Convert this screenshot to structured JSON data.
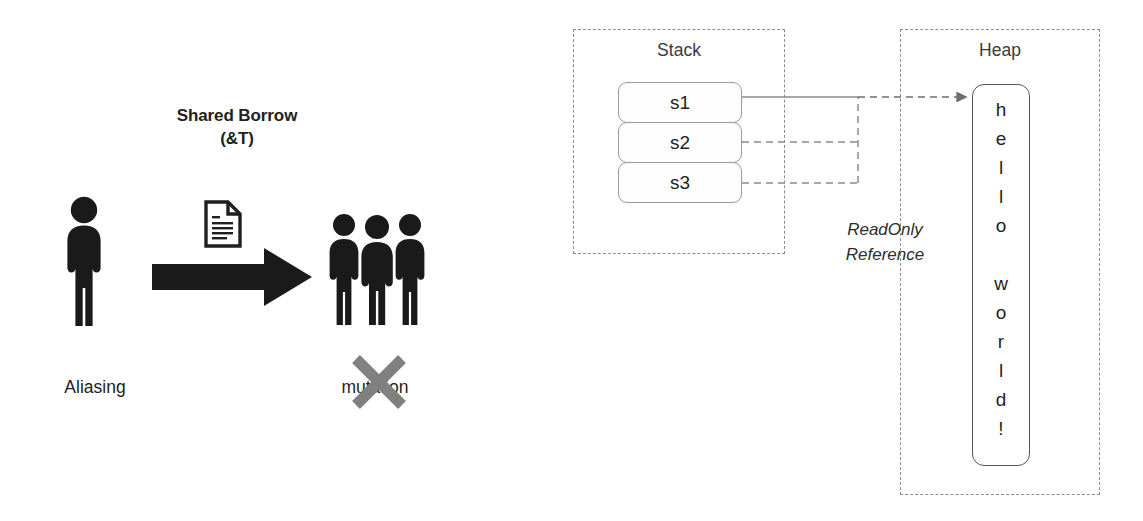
{
  "left_panel": {
    "heading": "Shared Borrow\n(&T)",
    "heading_line1": "Shared Borrow",
    "heading_line2": "(&T)",
    "source_caption": "Aliasing",
    "target_caption": "mutation",
    "source_icon": "single-person-icon",
    "transfer_icon": "document-icon",
    "arrow_icon": "thick-right-arrow-icon",
    "target_icon": "three-people-icon",
    "forbidden_icon": "gray-x-cross-icon",
    "forbidden_color": "#808080",
    "figure_color": "#1a1a1a"
  },
  "right_panel": {
    "stack": {
      "label": "Stack",
      "slots": [
        {
          "name": "s1",
          "link": "solid"
        },
        {
          "name": "s2",
          "link": "dashed"
        },
        {
          "name": "s3",
          "link": "dashed"
        }
      ]
    },
    "reference_label_line1": "ReadOnly",
    "reference_label_line2": "Reference",
    "arrow_icon": "reference-arrow-icon",
    "heap": {
      "label": "Heap",
      "value": "hello world!",
      "chars": [
        "h",
        "e",
        "l",
        "l",
        "o",
        " ",
        "w",
        "o",
        "r",
        "l",
        "d",
        "!"
      ]
    },
    "dashed_border_color": "#8c8c8c",
    "slot_border_color": "#9a9a9a",
    "heap_border_color": "#555555"
  }
}
